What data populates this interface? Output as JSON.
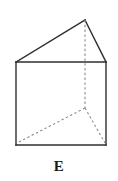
{
  "figure": {
    "label": "E",
    "shape_name": "triangular-prism",
    "colors": {
      "background": "#ffffff",
      "visible_edge": "#2e2e2e",
      "hidden_edge": "#8c8c8c",
      "label_text": "#1a1a1a"
    },
    "stroke": {
      "visible_width": 1.4,
      "hidden_width": 1.1,
      "hidden_dash": "2.4 2.4"
    },
    "vertices": {
      "front_top_left": [
        16,
        62
      ],
      "front_top_right": [
        106,
        62
      ],
      "front_bottom_left": [
        16,
        145
      ],
      "front_bottom_right": [
        106,
        145
      ],
      "apex_top": [
        85,
        20
      ],
      "hidden_back_vertex": [
        85,
        108
      ]
    },
    "visible_edges": [
      {
        "name": "front-face-top",
        "from": "front_top_left",
        "to": "front_top_right"
      },
      {
        "name": "front-face-left",
        "from": "front_top_left",
        "to": "front_bottom_left"
      },
      {
        "name": "front-face-right",
        "from": "front_top_right",
        "to": "front_bottom_right"
      },
      {
        "name": "front-face-bottom",
        "from": "front_bottom_left",
        "to": "front_bottom_right"
      },
      {
        "name": "roof-left-slant",
        "from": "front_top_left",
        "to": "apex_top"
      },
      {
        "name": "roof-right-slant",
        "from": "apex_top",
        "to": "front_top_right"
      }
    ],
    "hidden_edges": [
      {
        "name": "vertical-hidden-edge",
        "from": "apex_top",
        "to": "hidden_back_vertex"
      },
      {
        "name": "hidden-edge-to-bottom-left",
        "from": "hidden_back_vertex",
        "to": "front_bottom_left"
      },
      {
        "name": "hidden-edge-to-bottom-right",
        "from": "hidden_back_vertex",
        "to": "front_bottom_right"
      }
    ]
  }
}
